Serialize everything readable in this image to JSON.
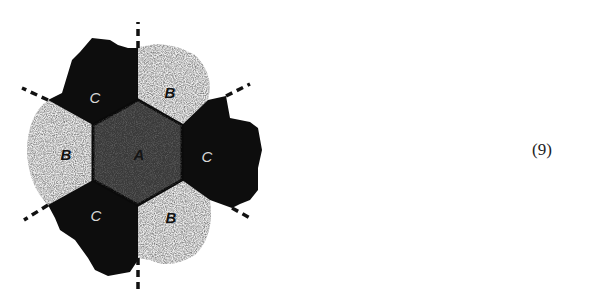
{
  "figure": {
    "type": "hexagonal region partition diagram",
    "center_label": "A",
    "labels": {
      "c_top_left": "C",
      "b_top_right": "B",
      "b_left": "B",
      "c_right": "C",
      "c_bottom_left": "C",
      "b_bottom_right": "B",
      "a_center": "A"
    },
    "colors": {
      "region_c": "#0d0d0d",
      "region_a": "#3a3a3a",
      "region_b": "#e6e6e6",
      "dash": "#111111",
      "label_on_dark": "#d9d9d9",
      "label_on_light": "#111111"
    }
  },
  "equation_number": "(9)"
}
